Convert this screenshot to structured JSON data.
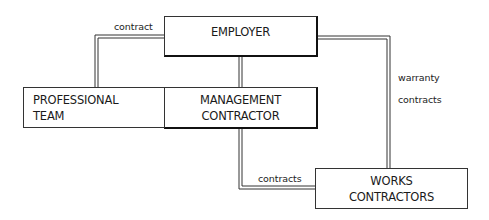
{
  "diagram": {
    "nodes": {
      "employer": {
        "label": "EMPLOYER"
      },
      "professional_team": {
        "line1": "PROFESSIONAL",
        "line2": "TEAM"
      },
      "management_contractor": {
        "line1": "MANAGEMENT",
        "line2": "CONTRACTOR"
      },
      "works_contractors": {
        "line1": "WORKS",
        "line2": "CONTRACTORS"
      }
    },
    "edges": {
      "employer_professional": {
        "label": "contract"
      },
      "employer_works": {
        "label1": "warranty",
        "label2": "contracts"
      },
      "management_works": {
        "label": "contracts"
      }
    },
    "colors": {
      "line": "#333333",
      "box_border": "#333333",
      "background": "#ffffff"
    }
  }
}
